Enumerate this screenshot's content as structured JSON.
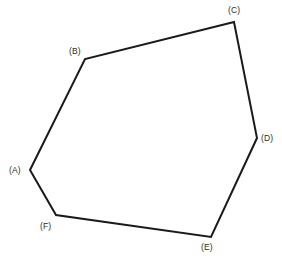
{
  "figure": {
    "type": "polygon-diagram",
    "shape_name": "hexagon",
    "background_color": "#ffffff",
    "width": 282,
    "height": 263,
    "stroke": {
      "color": "#1a1a1a",
      "width": 2,
      "fill": "none",
      "closed": true
    },
    "vertices": [
      {
        "id": "A",
        "label": "(A)",
        "x": 30,
        "y": 170,
        "label_x": 9,
        "label_y": 165
      },
      {
        "id": "B",
        "label": "(B)",
        "x": 85,
        "y": 59,
        "label_x": 69,
        "label_y": 46
      },
      {
        "id": "C",
        "label": "(C)",
        "x": 234,
        "y": 22,
        "label_x": 228,
        "label_y": 5
      },
      {
        "id": "D",
        "label": "(D)",
        "x": 257,
        "y": 138,
        "label_x": 261,
        "label_y": 133
      },
      {
        "id": "E",
        "label": "(E)",
        "x": 211,
        "y": 237,
        "label_x": 201,
        "label_y": 242
      },
      {
        "id": "F",
        "label": "(F)",
        "x": 56,
        "y": 215,
        "label_x": 40,
        "label_y": 221
      }
    ],
    "edges": [
      {
        "from": "A",
        "to": "B"
      },
      {
        "from": "B",
        "to": "C"
      },
      {
        "from": "C",
        "to": "D"
      },
      {
        "from": "D",
        "to": "E"
      },
      {
        "from": "E",
        "to": "F"
      },
      {
        "from": "F",
        "to": "A"
      }
    ]
  }
}
